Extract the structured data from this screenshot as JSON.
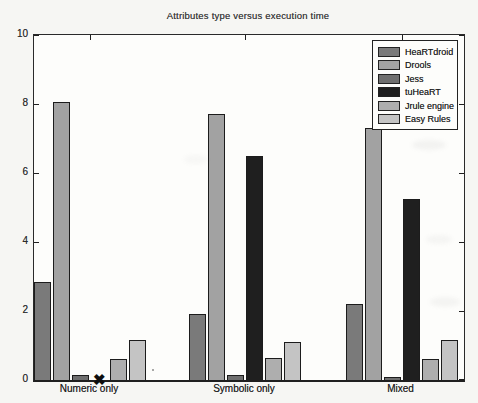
{
  "page": {
    "background": "#f6f6f3"
  },
  "chart_data": {
    "type": "bar",
    "title": "Attributes type versus execution time",
    "categories": [
      "Numeric only",
      "Symbolic only",
      "Mixed"
    ],
    "series": [
      {
        "name": "HeaRTdroid",
        "color": "#7a7a7a",
        "values": [
          2.85,
          1.9,
          2.2
        ]
      },
      {
        "name": "Drools",
        "color": "#a2a2a2",
        "values": [
          8.05,
          7.7,
          7.3
        ]
      },
      {
        "name": "Jess",
        "color": "#6f6f6f",
        "values": [
          0.15,
          0.15,
          0.1
        ]
      },
      {
        "name": "tuHeaRT",
        "color": "#1f1f1f",
        "values": [
          null,
          6.5,
          5.25
        ]
      },
      {
        "name": "Jrule engine",
        "color": "#aeaeae",
        "values": [
          0.6,
          0.65,
          0.6
        ]
      },
      {
        "name": "Easy Rules",
        "color": "#c4c4c4",
        "values": [
          1.15,
          1.1,
          1.15
        ]
      }
    ],
    "ylim": [
      0,
      10
    ],
    "yticks": [
      0,
      2,
      4,
      6,
      8,
      10
    ],
    "xlabel": "",
    "ylabel": "",
    "grid": false,
    "legend_position": "top-right",
    "annotations": [
      {
        "type": "missing-data-x-marker",
        "series": "tuHeaRT",
        "category": "Numeric only",
        "value": 0,
        "glyph": "✖"
      }
    ]
  }
}
